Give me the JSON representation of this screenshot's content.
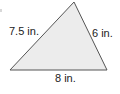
{
  "figure": {
    "shape": "triangle",
    "fill_color": "#ececec",
    "stroke_color": "#555555",
    "vertices": [
      [
        10,
        70
      ],
      [
        74,
        2
      ],
      [
        107,
        70
      ]
    ],
    "sides": {
      "left": "7.5 in.",
      "right": "6 in.",
      "bottom": "8 in."
    }
  }
}
